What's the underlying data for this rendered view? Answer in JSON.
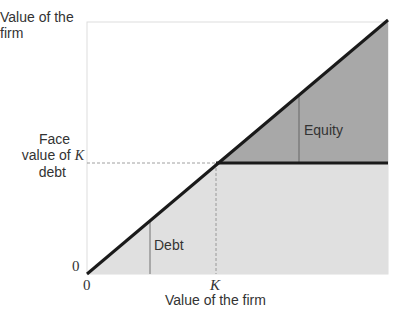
{
  "diagram": {
    "type": "payoff-diagram",
    "y_axis": {
      "title": "Value of the firm",
      "title_lines": [
        "Value of the",
        "firm"
      ],
      "zero_label": "0",
      "marked_level": {
        "label_lines": [
          "Face",
          "value of",
          "debt"
        ],
        "symbol": "K"
      }
    },
    "x_axis": {
      "title": "Value of the firm",
      "zero_label": "0",
      "k_label": "K"
    },
    "regions": [
      {
        "name": "Debt",
        "label": "Debt",
        "fill": "#e0e0e0"
      },
      {
        "name": "Equity",
        "label": "Equity",
        "fill": "#a8a8a8"
      }
    ],
    "lines": {
      "diagonal": "45-degree line: value of the firm",
      "horizontal": "debt cap at K",
      "color": "#1a1a1a"
    },
    "colors": {
      "debt_fill": "#e0e0e0",
      "equity_fill": "#a8a8a8",
      "frame": "#dddddd",
      "text": "#333333",
      "line": "#1a1a1a"
    }
  }
}
